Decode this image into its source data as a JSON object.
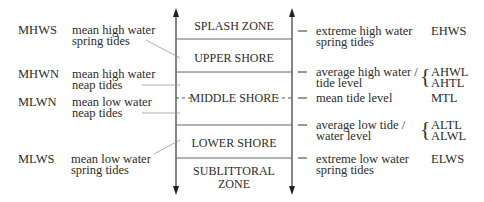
{
  "diagram": {
    "zones": [
      {
        "id": "splash",
        "label": "SPLASH ZONE"
      },
      {
        "id": "upper",
        "label": "UPPER SHORE"
      },
      {
        "id": "middle",
        "label": "MIDDLE SHORE"
      },
      {
        "id": "lower",
        "label": "LOWER SHORE"
      },
      {
        "id": "sublittoral",
        "label_line1": "SUBLITTORAL",
        "label_line2": "ZONE"
      }
    ],
    "left_levels": [
      {
        "abbr": "MHWS",
        "line1": "mean high water",
        "line2": "spring tides"
      },
      {
        "abbr": "MHWN",
        "line1": "mean high water",
        "line2": "neap tides"
      },
      {
        "abbr": "MLWN",
        "line1": "mean low water",
        "line2": "neap tides"
      },
      {
        "abbr": "MLWS",
        "line1": "mean low water",
        "line2": "spring tides"
      }
    ],
    "right_levels": [
      {
        "line1": "extreme high water",
        "line2": "spring tides",
        "abbr": "EHWS"
      },
      {
        "line1": "average high water /",
        "line2": "tide level",
        "abbr1": "AHWL",
        "abbr2": "AHTL"
      },
      {
        "line1": "mean tide level",
        "abbr": "MTL"
      },
      {
        "line1": "average low tide /",
        "line2": "water level",
        "abbr1": "ALTL",
        "abbr2": "ALWL"
      },
      {
        "line1": "extreme low water",
        "line2": "spring tides",
        "abbr": "ELWS"
      }
    ],
    "colors": {
      "line": "#444444",
      "pointer": "#888888",
      "text": "#2b2b2b"
    }
  }
}
